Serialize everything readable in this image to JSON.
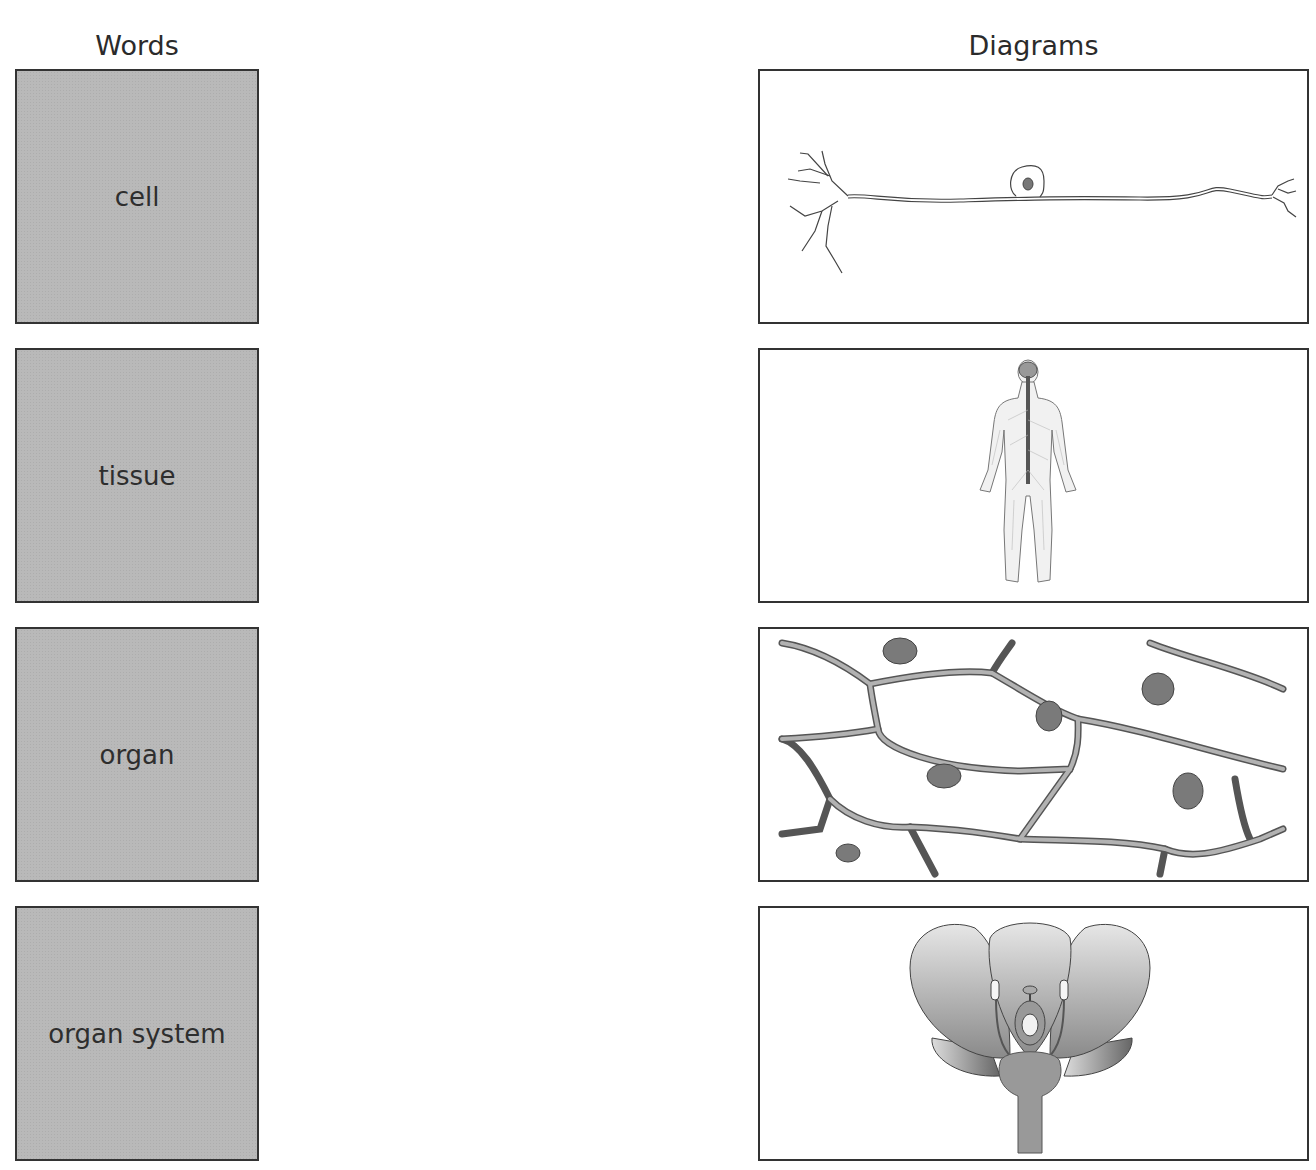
{
  "headers": {
    "words": "Words",
    "diagrams": "Diagrams"
  },
  "words": [
    {
      "label": "cell"
    },
    {
      "label": "tissue"
    },
    {
      "label": "organ"
    },
    {
      "label": "organ system"
    }
  ],
  "diagrams": [
    {
      "subject": "neuron (nerve cell)"
    },
    {
      "subject": "human nervous system"
    },
    {
      "subject": "plant cells (tissue)"
    },
    {
      "subject": "flower cross-section"
    }
  ],
  "colors": {
    "word_box_fill": "#b9b9b9",
    "border": "#333333"
  }
}
